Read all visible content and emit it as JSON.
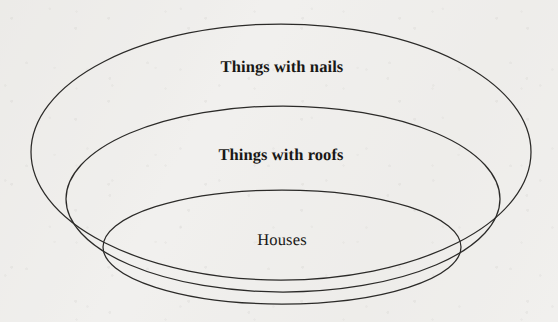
{
  "diagram": {
    "type": "euler-nested-sets",
    "background_color": "#f1f0ee",
    "stroke_color": "#2b2a28",
    "text_color": "#191816",
    "sets": [
      {
        "id": "nails",
        "label": "Things with nails",
        "level": 1,
        "shape": "ellipse",
        "cx": 281,
        "cy": 152,
        "rx": 250,
        "ry": 128,
        "label_x": 282,
        "label_y": 67,
        "font_weight": "bold"
      },
      {
        "id": "roofs",
        "label": "Things with roofs",
        "level": 2,
        "shape": "ellipse",
        "cx": 283,
        "cy": 199,
        "rx": 217,
        "ry": 93,
        "label_x": 281,
        "label_y": 155,
        "font_weight": "bold"
      },
      {
        "id": "houses",
        "label": "Houses",
        "level": 3,
        "shape": "ellipse",
        "cx": 282,
        "cy": 247,
        "rx": 179,
        "ry": 57,
        "label_x": 282,
        "label_y": 240,
        "font_weight": "normal"
      }
    ]
  }
}
